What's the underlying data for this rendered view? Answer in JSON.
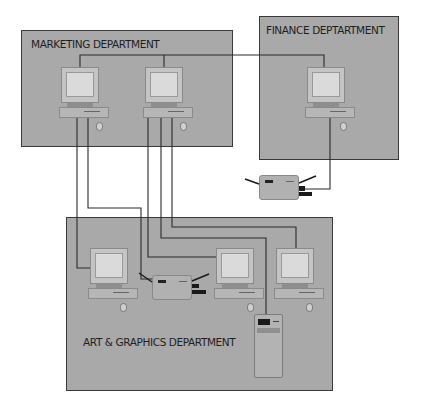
{
  "diagram": {
    "type": "office-network",
    "departments": [
      {
        "id": "marketing",
        "label": "MARKETING DEPARTMENT",
        "computers": 2
      },
      {
        "id": "finance",
        "label": "FINANCE DEPTARTMENT",
        "computers": 1,
        "devices": [
          "modem"
        ]
      },
      {
        "id": "art",
        "label": "ART & GRAPHICS DEPARTMENT",
        "computers": 3,
        "devices": [
          "modem",
          "tower-server"
        ]
      }
    ],
    "connections": [
      {
        "from": "marketing-computer-2",
        "to": "finance-computer-1"
      },
      {
        "from": "marketing-computer-1",
        "to": "art-computer-1"
      },
      {
        "from": "marketing-computer-1",
        "to": "art-modem"
      },
      {
        "from": "marketing-computer-2",
        "to": "art-computer-2"
      },
      {
        "from": "marketing-computer-2",
        "to": "art-tower"
      },
      {
        "from": "marketing-computer-2",
        "to": "art-computer-3"
      },
      {
        "from": "finance-computer-1",
        "to": "finance-modem"
      }
    ]
  },
  "colors": {
    "department_fill": "#a9a9a9",
    "border": "#3a3a3a",
    "wire": "#2a2a2a",
    "screen": "#dadada"
  }
}
